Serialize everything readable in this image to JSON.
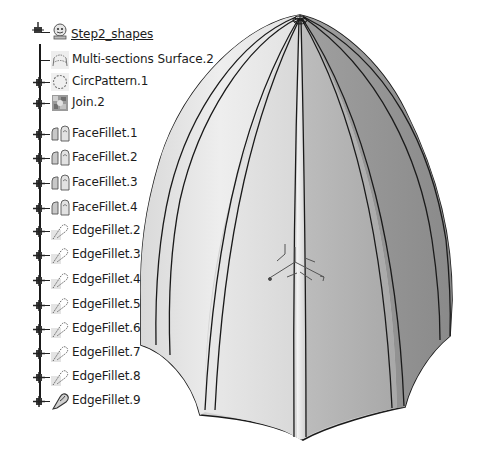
{
  "tree": {
    "root": {
      "label": "Step2_shapes",
      "icon": "body-gear-icon",
      "y": 24
    },
    "items": [
      {
        "label": "Multi-sections Surface.2",
        "icon": "multi-sections-surface-icon",
        "expandable": false,
        "y": 49
      },
      {
        "label": "CircPattern.1",
        "icon": "circular-pattern-icon",
        "expandable": true,
        "y": 71
      },
      {
        "label": "Join.2",
        "icon": "join-icon",
        "expandable": true,
        "y": 92
      },
      {
        "label": "FaceFillet.1",
        "icon": "face-fillet-icon",
        "expandable": true,
        "y": 123
      },
      {
        "label": "FaceFillet.2",
        "icon": "face-fillet-icon",
        "expandable": true,
        "y": 147
      },
      {
        "label": "FaceFillet.3",
        "icon": "face-fillet-icon",
        "expandable": true,
        "y": 172
      },
      {
        "label": "FaceFillet.4",
        "icon": "face-fillet-icon",
        "expandable": true,
        "y": 197
      },
      {
        "label": "EdgeFillet.2",
        "icon": "edge-fillet-icon",
        "expandable": true,
        "y": 220
      },
      {
        "label": "EdgeFillet.3",
        "icon": "edge-fillet-icon",
        "expandable": true,
        "y": 244
      },
      {
        "label": "EdgeFillet.4",
        "icon": "edge-fillet-icon",
        "expandable": true,
        "y": 269
      },
      {
        "label": "EdgeFillet.5",
        "icon": "edge-fillet-icon",
        "expandable": true,
        "y": 294
      },
      {
        "label": "EdgeFillet.6",
        "icon": "edge-fillet-icon",
        "expandable": true,
        "y": 318
      },
      {
        "label": "EdgeFillet.7",
        "icon": "edge-fillet-icon",
        "expandable": true,
        "y": 342
      },
      {
        "label": "EdgeFillet.8",
        "icon": "edge-fillet-icon",
        "expandable": true,
        "y": 366
      },
      {
        "label": "EdgeFillet.9",
        "icon": "edge-fillet-active-icon",
        "expandable": true,
        "y": 390
      }
    ]
  },
  "viewport": {
    "object": "fluted-dome-surface",
    "compass_axes": [
      "x",
      "y",
      "z"
    ],
    "colors": {
      "light_face": "#e6e6e6",
      "mid_face": "#c4c4c4",
      "dark_face": "#8f8f8f",
      "edge_line": "#1a1a1a",
      "background": "#ffffff"
    }
  }
}
